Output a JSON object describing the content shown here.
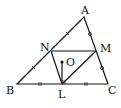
{
  "diagram": {
    "type": "geometry",
    "points": {
      "A": {
        "label": "A",
        "x": 84,
        "y": 17
      },
      "B": {
        "label": "B",
        "x": 17,
        "y": 84
      },
      "C": {
        "label": "C",
        "x": 108,
        "y": 84
      },
      "N": {
        "label": "N",
        "x": 51,
        "y": 51
      },
      "M": {
        "label": "M",
        "x": 96,
        "y": 51
      },
      "L": {
        "label": "L",
        "x": 62,
        "y": 84
      },
      "O": {
        "label": "O",
        "x": 62,
        "y": 62
      }
    },
    "segments": [
      "AB",
      "BC",
      "CA",
      "NM",
      "NL",
      "LM",
      "OL"
    ],
    "tick_marks": {
      "single_slash": [
        "AN",
        "NB"
      ],
      "double_slash": [
        "BL",
        "LC"
      ],
      "circle": [
        "AM",
        "MC"
      ]
    },
    "right_angle": "OL ⊥ BC at L",
    "colors": {
      "stroke": "#111111",
      "background": "#ffffff"
    }
  }
}
